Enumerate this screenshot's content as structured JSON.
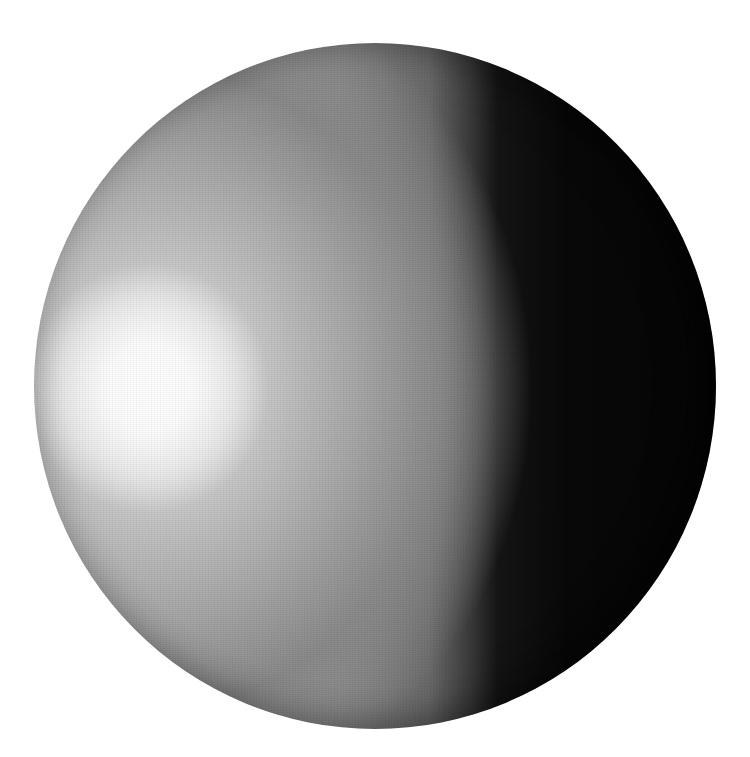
{
  "scene": {
    "subject": "shaded sphere",
    "background_color": "#ffffff",
    "sphere": {
      "center": [
        375,
        386
      ],
      "radius": 342,
      "highlight_center": [
        150,
        390
      ],
      "terminator_x": 510,
      "colors": {
        "highlight": "#ffffff",
        "midtone": "#8c8c8c",
        "shadow": "#050505"
      }
    }
  }
}
